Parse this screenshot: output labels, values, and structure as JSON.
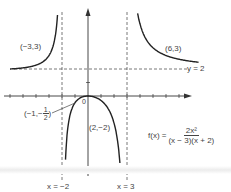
{
  "chart_data": {
    "type": "line",
    "title": "",
    "function": "f(x) = 2x^2 / ((x-3)(x+2))",
    "xlabel": "",
    "ylabel": "",
    "origin_label": "0",
    "grid": false,
    "vertical_asymptotes": [
      {
        "x": -2,
        "label": "x = −2"
      },
      {
        "x": 3,
        "label": "x = 3"
      }
    ],
    "horizontal_asymptotes": [
      {
        "y": 2,
        "label": "y = 2"
      }
    ],
    "labeled_points": [
      {
        "x": -3,
        "y": 3,
        "label": "(−3,3)"
      },
      {
        "x": 6,
        "y": 3,
        "label": "(6,3)"
      },
      {
        "x": -1,
        "y": -0.5,
        "label": "(−1,−1/2)"
      },
      {
        "x": 2,
        "y": -2,
        "label": "(2,−2)"
      },
      {
        "x": 0,
        "y": 0,
        "label": "0"
      }
    ],
    "branches": [
      {
        "name": "left",
        "domain": [
          -6,
          -2.15
        ]
      },
      {
        "name": "middle",
        "domain": [
          -1.85,
          2.9
        ]
      },
      {
        "name": "right",
        "domain": [
          3.15,
          8.5
        ]
      }
    ],
    "xlim": [
      -6.8,
      11.5
    ],
    "ylim": [
      -7,
      7
    ]
  },
  "labels": {
    "pt_m3_3": "(−3,3)",
    "pt_6_3": "(6,3)",
    "pt_m1_prefix": "(−1,−",
    "pt_m1_num": "1",
    "pt_m1_den": "2",
    "pt_m1_suffix": ")",
    "pt_2_m2": "(2,−2)",
    "origin": "0",
    "y_eq_2": "y = 2",
    "x_eq_m2": "x = −2",
    "x_eq_3": "x = 3",
    "formula_lhs": "f(x) =",
    "formula_num": "2x²",
    "formula_den": "(x − 3)(x + 2)"
  },
  "colors": {
    "curve": "#222222",
    "axis": "#333333",
    "asymptote": "#555555",
    "text": "#444444"
  }
}
